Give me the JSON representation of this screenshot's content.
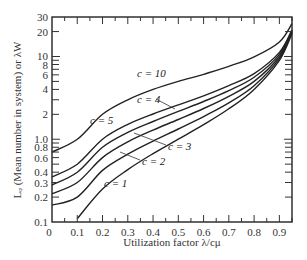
{
  "chart_data": {
    "type": "line",
    "title": "",
    "xlabel": "Utilization factor λ/cμ",
    "ylabel": "L_q (Mean number in system) or λW",
    "xlim": [
      0,
      0.95
    ],
    "ylim": [
      0.1,
      30
    ],
    "yscale": "log",
    "grid": false,
    "legend_position": "inline labels",
    "x_ticks": [
      "0",
      "0.1",
      "0.2",
      "0.3",
      "0.4",
      "0.5",
      "0.6",
      "0.7",
      "0.8",
      "0.9"
    ],
    "y_ticks": [
      "0.1",
      "0.2",
      "0.3",
      "0.4",
      "0.6",
      "0.8",
      "1.0",
      "2",
      "4",
      "6",
      "8",
      "10",
      "20",
      "30"
    ],
    "series": [
      {
        "name": "c = 1",
        "x": [
          0.1,
          0.2,
          0.3,
          0.4,
          0.5,
          0.6,
          0.7,
          0.8,
          0.9,
          0.95
        ],
        "values": [
          0.11,
          0.25,
          0.43,
          0.67,
          1.0,
          1.5,
          2.33,
          4.0,
          9.0,
          19.0
        ]
      },
      {
        "name": "c = 2",
        "x": [
          0.0,
          0.1,
          0.2,
          0.3,
          0.4,
          0.5,
          0.6,
          0.7,
          0.8,
          0.9,
          0.95
        ],
        "values": [
          0.16,
          0.2,
          0.42,
          0.66,
          0.95,
          1.33,
          1.88,
          2.75,
          4.44,
          9.47,
          19.5
        ]
      },
      {
        "name": "c = 3",
        "x": [
          0.0,
          0.1,
          0.2,
          0.3,
          0.4,
          0.5,
          0.6,
          0.7,
          0.8,
          0.9,
          0.95
        ],
        "values": [
          0.22,
          0.3,
          0.6,
          0.93,
          1.29,
          1.73,
          2.35,
          3.3,
          5.0,
          10.0,
          20.0
        ]
      },
      {
        "name": "c = 4",
        "x": [
          0.0,
          0.1,
          0.2,
          0.3,
          0.4,
          0.5,
          0.6,
          0.7,
          0.8,
          0.9,
          0.95
        ],
        "values": [
          0.28,
          0.4,
          0.8,
          1.21,
          1.64,
          2.17,
          2.86,
          3.87,
          5.6,
          10.6,
          20.5
        ]
      },
      {
        "name": "c = 5",
        "x": [
          0.0,
          0.1,
          0.2,
          0.3,
          0.4,
          0.5,
          0.6,
          0.7,
          0.8,
          0.9,
          0.95
        ],
        "values": [
          0.35,
          0.5,
          1.0,
          1.51,
          2.02,
          2.6,
          3.35,
          4.45,
          6.2,
          11.2,
          21.0
        ]
      },
      {
        "name": "c = 10",
        "x": [
          0.0,
          0.1,
          0.2,
          0.3,
          0.4,
          0.5,
          0.6,
          0.7,
          0.8,
          0.9,
          0.95
        ],
        "values": [
          0.7,
          1.0,
          2.0,
          3.0,
          4.0,
          5.0,
          6.1,
          7.6,
          9.9,
          15.0,
          25.0
        ]
      }
    ],
    "annotations": [
      "c = 10",
      "c = 5",
      "c = 4",
      "c = 3",
      "c = 2",
      "c = 1"
    ]
  },
  "labels": {
    "xlabel": "Utilization factor λ/cμ",
    "ylabel": "Lᵩ (Mean number in system) or λW",
    "c1": "c = 1",
    "c2": "c = 2",
    "c3": "c = 3",
    "c4": "c = 4",
    "c5": "c = 5",
    "c10": "c = 10"
  },
  "xticks": [
    "0",
    "0.1",
    "0.2",
    "0.3",
    "0.4",
    "0.5",
    "0.6",
    "0.7",
    "0.8",
    "0.9"
  ],
  "yticks": [
    "30",
    "20",
    "10",
    "8",
    "6",
    "4",
    "2",
    "1.0",
    "0.8",
    "0.6",
    "0.4",
    "0.3",
    "0.2",
    "0.1"
  ]
}
